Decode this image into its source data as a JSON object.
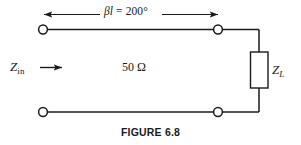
{
  "figure": {
    "caption": "FIGURE 6.8",
    "dimension": {
      "symbol": "βl",
      "equals": " = ",
      "value": "200°",
      "full_text": "βl = 200°"
    },
    "input_impedance": {
      "symbol": "Z",
      "subscript": "in",
      "full_text": "Zin"
    },
    "characteristic_impedance": {
      "full_text": "50 Ω",
      "value": "50",
      "unit": "Ω"
    },
    "load_impedance": {
      "symbol": "Z",
      "subscript": "L",
      "full_text": "ZL"
    },
    "colors": {
      "line": "#1a1a1a",
      "background": "#ffffff",
      "text": "#1a1a1a"
    }
  }
}
